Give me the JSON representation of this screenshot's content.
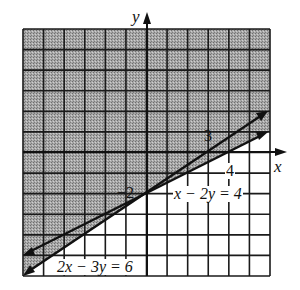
{
  "chart_data": {
    "type": "line",
    "title": "",
    "xlabel": "x",
    "ylabel": "y",
    "xlim": [
      -6,
      6
    ],
    "ylim": [
      -6,
      6
    ],
    "grid": true,
    "grid_step": 1,
    "shading": {
      "description": "Shaded region above both boundary lines (y >= min of the two lines)",
      "inequalities": [
        "x - 2y <= 4",
        "2x - 3y <= 6"
      ],
      "combination": "union",
      "fill_color": "#9a9a9a"
    },
    "series": [
      {
        "name": "x - 2y = 4",
        "equation": "y = x/2 - 2",
        "points": [
          [
            -6,
            -5
          ],
          [
            0,
            -2
          ],
          [
            4,
            0
          ],
          [
            6,
            1
          ]
        ],
        "x_intercept": 4,
        "y_intercept": -2
      },
      {
        "name": "2x - 3y = 6",
        "equation": "y = 2x/3 - 2",
        "points": [
          [
            -6,
            -6
          ],
          [
            0,
            -2
          ],
          [
            3,
            0
          ],
          [
            6,
            2
          ]
        ],
        "x_intercept": 3,
        "y_intercept": -2
      }
    ],
    "annotations": [
      {
        "text": "3",
        "x": 3,
        "y": 0.6
      },
      {
        "text": "4",
        "x": 4,
        "y": -0.9
      },
      {
        "text": "-2",
        "x": -0.5,
        "y": -2
      },
      {
        "text": "x - 2y = 4",
        "x": 2.6,
        "y": -2
      },
      {
        "text": "2x - 3y = 6",
        "x": -3.5,
        "y": -5.4
      }
    ]
  },
  "labels": {
    "y_axis": "y",
    "x_axis": "x",
    "tick_3": "3",
    "tick_4": "4",
    "tick_neg2": "−2",
    "eq1": "x − 2y = 4",
    "eq2": "2x − 3y = 6"
  },
  "colors": {
    "shade": "#9a9a9a",
    "ink": "#111111",
    "background": "#ffffff"
  }
}
